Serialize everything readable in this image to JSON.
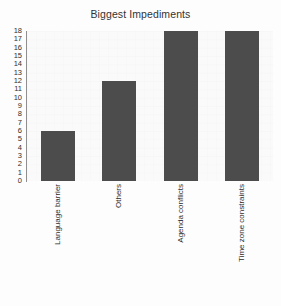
{
  "chart_data": {
    "type": "bar",
    "title": "Biggest Impediments",
    "xlabel": "",
    "ylabel": "",
    "categories": [
      "Language barrier",
      "Others",
      "Agenda conflicts",
      "Time zone constraints"
    ],
    "values": [
      6,
      12,
      18,
      18
    ],
    "ylim": [
      0,
      18
    ],
    "ytick_step": 1,
    "yticks": [
      18,
      17,
      16,
      15,
      14,
      13,
      12,
      11,
      10,
      9,
      8,
      7,
      6,
      5,
      4,
      3,
      2,
      1,
      0
    ],
    "grid": false,
    "legend": null,
    "orientation": "vertical",
    "xtick_rotation": 90,
    "colors": {
      "bar": "#4c4c4c",
      "plot_background": "#fafafa",
      "figure_background": "#fdfdfd",
      "axis": "#8f8f8f",
      "text": "#2e2e2e",
      "title": "#333333"
    }
  }
}
